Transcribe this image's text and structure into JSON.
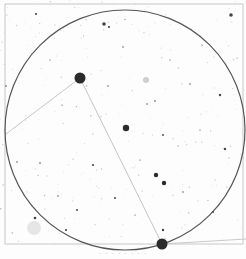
{
  "chart": {
    "kind": "inverted-star-field-finder-chart",
    "background": "#fdfdfd",
    "frame": {
      "x": 5,
      "y": 4,
      "w": 238,
      "h": 240,
      "color": "#c8c8c8"
    },
    "circle": {
      "cx": 125,
      "cy": 130,
      "r": 120,
      "color": "#555555"
    },
    "lines": [
      {
        "x1": 80,
        "y1": 78,
        "x2": 6,
        "y2": 134,
        "color": "#d0c4c4"
      },
      {
        "x1": 80,
        "y1": 78,
        "x2": 162,
        "y2": 244,
        "color": "#c4c4cc"
      },
      {
        "x1": 162,
        "y1": 244,
        "x2": 246,
        "y2": 239,
        "color": "#c8c8c8"
      }
    ],
    "stars": [
      {
        "x": 80,
        "y": 78,
        "r": 5.5
      },
      {
        "x": 162,
        "y": 244,
        "r": 5.5
      },
      {
        "x": 126,
        "y": 128,
        "r": 3.2
      },
      {
        "x": 156,
        "y": 175,
        "r": 2.2
      },
      {
        "x": 164,
        "y": 183,
        "r": 2.2
      },
      {
        "x": 104,
        "y": 24,
        "r": 1.8
      },
      {
        "x": 231,
        "y": 15,
        "r": 1.8
      },
      {
        "x": 109,
        "y": 27,
        "r": 1.1
      },
      {
        "x": 36,
        "y": 14,
        "r": 1.1
      },
      {
        "x": 220,
        "y": 95,
        "r": 1.2
      },
      {
        "x": 225,
        "y": 149,
        "r": 1.2
      },
      {
        "x": 93,
        "y": 165,
        "r": 1.1
      },
      {
        "x": 115,
        "y": 198,
        "r": 1.0
      },
      {
        "x": 77,
        "y": 210,
        "r": 1.0
      },
      {
        "x": 35,
        "y": 218,
        "r": 1.3
      },
      {
        "x": 66,
        "y": 230,
        "r": 1.1
      },
      {
        "x": 163,
        "y": 230,
        "r": 1.2
      },
      {
        "x": 163,
        "y": 135,
        "r": 0.9
      },
      {
        "x": 155,
        "y": 101,
        "r": 0.8
      },
      {
        "x": 147,
        "y": 104,
        "r": 0.7
      },
      {
        "x": 213,
        "y": 212,
        "r": 0.9
      },
      {
        "x": 6,
        "y": 86,
        "r": 0.8
      },
      {
        "x": 40,
        "y": 163,
        "r": 0.8
      },
      {
        "x": 17,
        "y": 162,
        "r": 0.7
      },
      {
        "x": 108,
        "y": 86,
        "r": 0.7
      },
      {
        "x": 123,
        "y": 47,
        "r": 0.7
      },
      {
        "x": 190,
        "y": 84,
        "r": 0.7
      },
      {
        "x": 58,
        "y": 196,
        "r": 0.7
      },
      {
        "x": 183,
        "y": 192,
        "r": 0.7
      },
      {
        "x": 202,
        "y": 45,
        "r": 0.6
      },
      {
        "x": 62,
        "y": 105,
        "r": 0.6
      },
      {
        "x": 135,
        "y": 215,
        "r": 0.6
      },
      {
        "x": 50,
        "y": 60,
        "r": 0.6
      },
      {
        "x": 170,
        "y": 60,
        "r": 0.6
      },
      {
        "x": 200,
        "y": 130,
        "r": 0.6
      },
      {
        "x": 140,
        "y": 160,
        "r": 0.6
      }
    ],
    "faint_patches": [
      {
        "x": 146,
        "y": 80,
        "r": 3,
        "color": "#cfcfcf"
      },
      {
        "x": 34,
        "y": 228,
        "r": 7,
        "color": "#e6e6e6"
      }
    ],
    "caption": "· ·  ·   ·   · ·  · ·"
  }
}
